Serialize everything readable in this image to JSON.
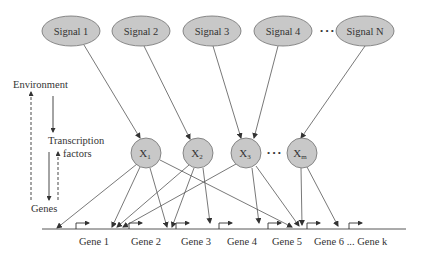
{
  "diagram": {
    "colors": {
      "node_fill": "#c8c8c8",
      "node_stroke": "#6e6e6e",
      "edge": "#555555",
      "text": "#333333"
    },
    "signals": [
      {
        "id": "s1",
        "label": "Signal 1",
        "cx": 71,
        "cy": 31
      },
      {
        "id": "s2",
        "label": "Signal 2",
        "cx": 141,
        "cy": 31
      },
      {
        "id": "s3",
        "label": "Signal 3",
        "cx": 212,
        "cy": 31
      },
      {
        "id": "s4",
        "label": "Signal 4",
        "cx": 277,
        "cy": 31
      },
      {
        "id": "sN",
        "label": "Signal N",
        "cx": 365,
        "cy": 31
      }
    ],
    "signal_ellipsis": "• • •",
    "transcription_factors": [
      {
        "id": "x1",
        "label": "X",
        "sub": "1",
        "cx": 146,
        "cy": 153
      },
      {
        "id": "x2",
        "label": "X",
        "sub": "2",
        "cx": 198,
        "cy": 153
      },
      {
        "id": "x3",
        "label": "X",
        "sub": "3",
        "cx": 246,
        "cy": 153
      },
      {
        "id": "xm",
        "label": "X",
        "sub": "m",
        "cx": 302,
        "cy": 153
      }
    ],
    "tf_ellipsis": "• • •",
    "side_labels": {
      "environment": "Environment",
      "transcription": "Transcription",
      "factors": "factors",
      "genes": "Genes"
    },
    "genes": [
      {
        "label": "Gene 1",
        "x": 88
      },
      {
        "label": "Gene 2",
        "x": 140
      },
      {
        "label": "Gene 3",
        "x": 190
      },
      {
        "label": "Gene 4",
        "x": 236
      },
      {
        "label": "Gene 5",
        "x": 281
      },
      {
        "label": "Gene 6 ... Gene k",
        "x": 348
      }
    ],
    "signal_edges": [
      {
        "from": "s1",
        "to": "x1"
      },
      {
        "from": "s2",
        "to": "x2"
      },
      {
        "from": "s3",
        "to": "x3"
      },
      {
        "from": "s4",
        "to": "x3"
      },
      {
        "from": "sN",
        "to": "xm"
      }
    ],
    "tf_edges": [
      {
        "from": "x1",
        "to_x": 57
      },
      {
        "from": "x1",
        "to_x": 111
      },
      {
        "from": "x1",
        "to_x": 167
      },
      {
        "from": "x1",
        "to_x": 293
      },
      {
        "from": "x2",
        "to_x": 116
      },
      {
        "from": "x2",
        "to_x": 172
      },
      {
        "from": "x2",
        "to_x": 210
      },
      {
        "from": "x3",
        "to_x": 122
      },
      {
        "from": "x3",
        "to_x": 259
      },
      {
        "from": "x3",
        "to_x": 300
      },
      {
        "from": "xm",
        "to_x": 303
      },
      {
        "from": "xm",
        "to_x": 338
      }
    ]
  }
}
